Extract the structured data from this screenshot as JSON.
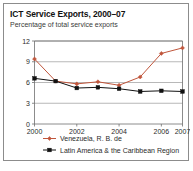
{
  "figure": {
    "title": "ICT Service Exports, 2000–07",
    "subtitle": "Percentage of total service exports",
    "border_color": "#8c8c8c"
  },
  "chart_data": {
    "type": "line",
    "title": "ICT Service Exports, 2000–07",
    "subtitle": "Percentage of total service exports",
    "xlabel": "",
    "ylabel": "",
    "x": [
      2000,
      2001,
      2002,
      2003,
      2004,
      2005,
      2006,
      2007
    ],
    "categories": [
      "2000",
      "2001",
      "2002",
      "2003",
      "2004",
      "2005",
      "2006",
      "2007"
    ],
    "xtick_labels": [
      "2000",
      "2002",
      "2004",
      "2006",
      "2007"
    ],
    "xticks": [
      2000,
      2002,
      2004,
      2006,
      2007
    ],
    "ytick_labels": [
      "0",
      "3",
      "6",
      "9",
      "12"
    ],
    "yticks": [
      0,
      3,
      6,
      9,
      12
    ],
    "ylim": [
      0,
      12
    ],
    "xlim": [
      2000,
      2007
    ],
    "grid": true,
    "legend_position": "bottom",
    "series": [
      {
        "name": "Venezuela, R. B. de",
        "color": "#c0563c",
        "marker": "diamond",
        "values": [
          9.4,
          6.2,
          5.8,
          6.1,
          5.6,
          6.8,
          10.2,
          11.0
        ]
      },
      {
        "name": "Latin America & the Caribbean Region",
        "color": "#111111",
        "marker": "square",
        "values": [
          6.6,
          6.2,
          5.2,
          5.3,
          5.1,
          4.7,
          4.8,
          4.7
        ]
      }
    ]
  },
  "legend": {
    "items": [
      {
        "label": "Venezuela, R. B. de",
        "color": "#c0563c",
        "marker": "diamond"
      },
      {
        "label": "Latin America & the Caribbean Region",
        "color": "#111111",
        "marker": "square"
      }
    ]
  }
}
